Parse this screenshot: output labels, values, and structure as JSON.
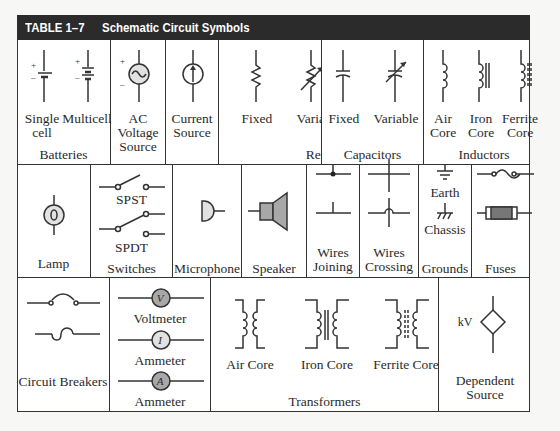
{
  "table": {
    "number": "TABLE 1–7",
    "title": "Schematic Circuit Symbols",
    "header_color": "#2b2b2b"
  },
  "row1": {
    "batteries": {
      "group": "Batteries",
      "items": [
        "Single\ncell",
        "Multicell"
      ]
    },
    "ac_source": {
      "label": "AC Voltage Source"
    },
    "current_source": {
      "label": "Current Source"
    },
    "resistors": {
      "group": "Resistors",
      "items": [
        "Fixed",
        "Variable"
      ]
    },
    "capacitors": {
      "group": "Capacitors",
      "items": [
        "Fixed",
        "Variable"
      ]
    },
    "inductors": {
      "group": "Inductors",
      "items": [
        "Air Core",
        "Iron Core",
        "Ferrite Core"
      ]
    }
  },
  "row2": {
    "lamp": "Lamp",
    "switches": {
      "group": "Switches",
      "items": [
        "SPST",
        "SPDT"
      ]
    },
    "microphone": "Microphone",
    "speaker": "Speaker",
    "wires_joining": "Wires Joining",
    "wires_crossing": "Wires Crossing",
    "grounds": {
      "group": "Grounds",
      "items": [
        "Earth",
        "Chassis"
      ]
    },
    "fuses": "Fuses"
  },
  "row3": {
    "circuit_breakers": "Circuit Breakers",
    "meters": {
      "items": [
        "Voltmeter",
        "Ammeter",
        "Ammeter"
      ],
      "glyphs": [
        "V",
        "I",
        "A"
      ]
    },
    "transformers": {
      "group": "Transformers",
      "items": [
        "Air Core",
        "Iron Core",
        "Ferrite Core"
      ]
    },
    "dependent_source": {
      "label": "Dependent Source",
      "glyph": "kV"
    }
  },
  "colors": {
    "symbol_fill": "#a8a8a8",
    "light_fill": "#e2e2e2",
    "line": "#333333"
  }
}
